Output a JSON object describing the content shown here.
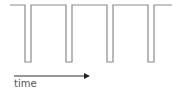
{
  "diagram": {
    "title": "",
    "axis_label": "time",
    "colors": {
      "waveform": "#8a8a8a",
      "arrow": "#333333",
      "text": "#555555"
    },
    "waveform": {
      "high_y": 5,
      "low_y": 62,
      "start_x": 10,
      "end_x": 172,
      "pulses": [
        {
          "x1": 25,
          "x2": 31
        },
        {
          "x1": 66,
          "x2": 72
        },
        {
          "x1": 107,
          "x2": 113
        },
        {
          "x1": 148,
          "x2": 154
        }
      ]
    },
    "arrow": {
      "x1": 14,
      "x2": 90,
      "y": 76
    }
  }
}
